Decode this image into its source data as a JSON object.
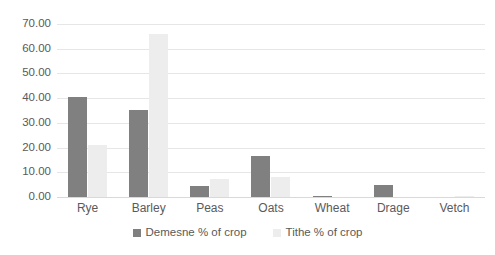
{
  "chart_data": {
    "type": "bar",
    "title": "",
    "subtitle": "",
    "xlabel": "",
    "ylabel": "",
    "ylim": [
      0,
      70
    ],
    "ytick_step": 10,
    "ytick_labels": [
      "0.00",
      "10.00",
      "20.00",
      "30.00",
      "40.00",
      "50.00",
      "60.00",
      "70.00"
    ],
    "ytick_values": [
      0,
      10,
      20,
      30,
      40,
      50,
      60,
      70
    ],
    "grid": true,
    "legend_position": "bottom",
    "categories": [
      "Rye",
      "Barley",
      "Peas",
      "Oats",
      "Wheat",
      "Drage",
      "Vetch"
    ],
    "series": [
      {
        "name": "Demesne % of crop",
        "color": "#808080",
        "values": [
          40.6,
          35.4,
          4.3,
          16.5,
          0.5,
          4.7,
          0.0
        ]
      },
      {
        "name": "Tithe % of crop",
        "color": "#ededed",
        "values": [
          20.9,
          65.9,
          7.1,
          8.0,
          0.0,
          0.0,
          0.3
        ]
      }
    ]
  },
  "legend": {
    "entries": [
      {
        "label": "Demesne % of crop"
      },
      {
        "label": "Tithe % of crop"
      }
    ]
  },
  "colors": {
    "demesne": "#808080",
    "tithe": "#ededed",
    "gridline": "#e6e6e6",
    "axis_text": "#5a5a5a",
    "background": "#ffffff"
  }
}
